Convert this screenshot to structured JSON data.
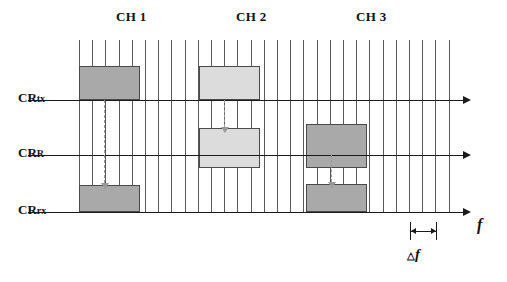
{
  "figure": {
    "type": "diagram",
    "axis_label": "f",
    "spacing_label_delta": "△",
    "spacing_label_f": "f",
    "colors": {
      "block_dark": "#a9a9a9",
      "block_light": "#dcdcdc",
      "block_border": "#4a4a4a",
      "gridline": "#5a5a5a",
      "axis": "#1a1a1a",
      "dashed_arrow": "#9a9a9a",
      "background": "#ffffff"
    }
  },
  "channels": [
    {
      "label": "CH 1",
      "x": 116
    },
    {
      "label": "CH 2",
      "x": 236
    },
    {
      "label": "CH 3",
      "x": 356
    }
  ],
  "rows": [
    {
      "id": "crtx",
      "label_main": "CR",
      "label_sub": "tx",
      "axis_y": 100
    },
    {
      "id": "crr",
      "label_main": "CR",
      "label_sub": "R",
      "axis_y": 155
    },
    {
      "id": "crrx",
      "label_main": "CR",
      "label_sub": "rx",
      "axis_y": 212
    }
  ],
  "axis": {
    "x_start": 28,
    "x_end": 468,
    "f_label": "f"
  },
  "gridlines": {
    "x_start": 79,
    "spacing": 13.2,
    "count": 29,
    "y_top": 40,
    "y_bottom": 212
  },
  "blocks": [
    {
      "id": "ch1-tx",
      "channel": "CH 1",
      "row": "crtx",
      "x": 79,
      "y": 66,
      "w": 61,
      "h": 34,
      "shade": "dark"
    },
    {
      "id": "ch1-rx",
      "channel": "CH 1",
      "row": "crrx",
      "x": 79,
      "y": 185,
      "w": 61,
      "h": 27,
      "shade": "dark"
    },
    {
      "id": "ch2-tx",
      "channel": "CH 2",
      "row": "crtx",
      "x": 199,
      "y": 66,
      "w": 61,
      "h": 34,
      "shade": "light"
    },
    {
      "id": "ch2-r",
      "channel": "CH 2",
      "row": "crr",
      "x": 199,
      "y": 128,
      "w": 61,
      "h": 40,
      "shade": "light"
    },
    {
      "id": "ch3-r",
      "channel": "CH 3",
      "row": "crr",
      "x": 306,
      "y": 124,
      "w": 61,
      "h": 44,
      "shade": "dark"
    },
    {
      "id": "ch3-rx",
      "channel": "CH 3",
      "row": "crrx",
      "x": 306,
      "y": 184,
      "w": 61,
      "h": 28,
      "shade": "dark"
    }
  ],
  "dashed_arrows": [
    {
      "id": "arrow-ch1",
      "x": 104,
      "y_start": 100,
      "y_end": 183
    },
    {
      "id": "arrow-ch2",
      "x": 224,
      "y_start": 100,
      "y_end": 127
    },
    {
      "id": "arrow-ch3",
      "x": 331,
      "y_start": 155,
      "y_end": 182
    }
  ],
  "delta_marker": {
    "x_left": 410,
    "x_right": 436,
    "y": 231,
    "tick_top": 222,
    "tick_height": 18,
    "label_delta": "△",
    "label_f": "f",
    "label_x": 407,
    "label_y": 253
  }
}
